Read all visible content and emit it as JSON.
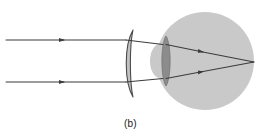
{
  "figure": {
    "label": "(b)",
    "caption_position": "bottom-center",
    "background_color": "#ffffff",
    "width": 261,
    "height": 138
  },
  "colors": {
    "eyeball_fill": "#c9c9c9",
    "cornea_fill": "#c9c9c9",
    "eye_lens_fill": "#8c8c8c",
    "eye_lens_stroke": "#6e6e6e",
    "corrective_lens_fill": "#c2c2c2",
    "corrective_lens_stroke": "#4a4a4a",
    "ray_color": "#3b3b3b",
    "label_color": "#1a1a1a"
  },
  "diagram": {
    "type": "optics-ray-diagram",
    "optical_axis_y": 61,
    "eyeball": {
      "name": "eyeball",
      "center_x": 205,
      "center_y": 61,
      "radius": 49
    },
    "cornea": {
      "name": "cornea-bump",
      "center_x": 160,
      "center_y": 61,
      "rx": 9,
      "ry": 16
    },
    "eye_lens": {
      "name": "crystalline-lens",
      "center_x": 166,
      "center_y": 61,
      "half_height": 25,
      "half_width": 4.5
    },
    "corrective_lens": {
      "name": "corrective-meniscus-lens",
      "type": "diverging-meniscus",
      "x_center": 129,
      "top_y": 30,
      "bottom_y": 97,
      "front_bulge": 9,
      "back_bulge": 4
    },
    "rays": [
      {
        "name": "ray-upper",
        "incident": {
          "x1": 6,
          "y1": 40,
          "x2": 125,
          "y2": 40
        },
        "arrow_at": {
          "x": 64,
          "y": 40
        },
        "between_lenses": {
          "x1": 125,
          "y1": 40,
          "x2": 163,
          "y2": 44
        },
        "refracted": {
          "x1": 166,
          "y1": 44,
          "x2": 253,
          "y2": 62
        },
        "arrow_at_2": {
          "x": 203,
          "y": 52
        }
      },
      {
        "name": "ray-lower",
        "incident": {
          "x1": 6,
          "y1": 82,
          "x2": 125,
          "y2": 82
        },
        "arrow_at": {
          "x": 64,
          "y": 82
        },
        "between_lenses": {
          "x1": 125,
          "y1": 82,
          "x2": 163,
          "y2": 79
        },
        "refracted": {
          "x1": 166,
          "y1": 79,
          "x2": 253,
          "y2": 62
        },
        "arrow_at_2": {
          "x": 203,
          "y": 72
        }
      }
    ],
    "focal_point": {
      "name": "retina-focus-point",
      "x": 253,
      "y": 62
    }
  }
}
